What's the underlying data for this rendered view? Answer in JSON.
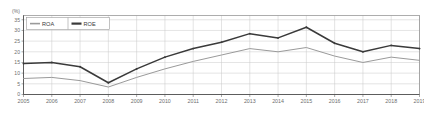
{
  "chart_data": {
    "type": "line",
    "title": "",
    "subtitle": "",
    "xlabel": "",
    "ylabel": "",
    "unit_label": "(%)",
    "grid": true,
    "legend_position": "top-left",
    "x": [
      "2005",
      "2006",
      "2007",
      "2008",
      "2009",
      "2010",
      "2011",
      "2012",
      "2013",
      "2014",
      "2015",
      "2016",
      "2017",
      "2018",
      "2019"
    ],
    "categories": [
      "2005",
      "2006",
      "2007",
      "2008",
      "2009",
      "2010",
      "2011",
      "2012",
      "2013",
      "2014",
      "2015",
      "2016",
      "2017",
      "2018",
      "2019"
    ],
    "xlim": [
      2005,
      2019
    ],
    "ylim": [
      0,
      37
    ],
    "yticks": [
      0,
      5,
      10,
      15,
      20,
      25,
      30,
      35
    ],
    "ytick_labels": [
      "0",
      "5",
      "10",
      "15",
      "20",
      "25",
      "30",
      "35"
    ],
    "series": [
      {
        "name": "ROA",
        "color": "#9a9a9a",
        "width": 1.0,
        "values": [
          7.5,
          8.0,
          6.5,
          3.5,
          8.0,
          12.0,
          15.5,
          18.5,
          21.5,
          20.0,
          22.0,
          18.0,
          15.0,
          17.5,
          16.0
        ]
      },
      {
        "name": "ROE",
        "color": "#3a3a3a",
        "width": 1.5,
        "values": [
          14.5,
          15.0,
          13.0,
          5.5,
          12.0,
          17.5,
          21.5,
          24.5,
          28.5,
          26.5,
          31.5,
          24.0,
          20.0,
          23.0,
          21.5
        ]
      }
    ]
  },
  "legend": {
    "items": [
      {
        "label": "ROA",
        "color": "#9a9a9a"
      },
      {
        "label": "ROE",
        "color": "#3a3a3a"
      }
    ]
  },
  "axes": {
    "unit": "(%)",
    "y_labels": [
      "35",
      "30",
      "25",
      "20",
      "15",
      "10",
      "5",
      "0"
    ],
    "x_labels": [
      "2005",
      "2006",
      "2007",
      "2008",
      "2009",
      "2010",
      "2011",
      "2012",
      "2013",
      "2014",
      "2015",
      "2016",
      "2017",
      "2018",
      "2019"
    ]
  },
  "colors": {
    "roa": "#9a9a9a",
    "roe": "#3a3a3a",
    "grid": "#c8c8c8",
    "axis": "#6e6e6e",
    "background": "#ffffff"
  }
}
